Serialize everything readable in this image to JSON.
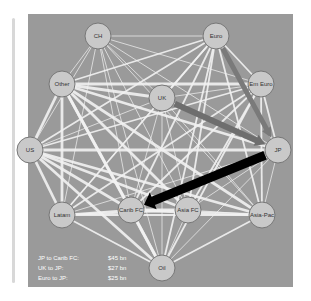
{
  "nodes": [
    {
      "id": "CH",
      "label": "CH",
      "x": 98,
      "y": 36
    },
    {
      "id": "Euro",
      "label": "Euro",
      "x": 216,
      "y": 36
    },
    {
      "id": "Other",
      "label": "Other",
      "x": 62,
      "y": 84
    },
    {
      "id": "UK",
      "label": "UK",
      "x": 162,
      "y": 98
    },
    {
      "id": "EmEuro",
      "label": "Em Euro",
      "x": 261,
      "y": 84
    },
    {
      "id": "US",
      "label": "US",
      "x": 30,
      "y": 150
    },
    {
      "id": "JP",
      "label": "JP",
      "x": 278,
      "y": 150
    },
    {
      "id": "Latam",
      "label": "Latam",
      "x": 62,
      "y": 215
    },
    {
      "id": "CaribFC",
      "label": "Carib FC",
      "x": 131,
      "y": 210
    },
    {
      "id": "AsiaFC",
      "label": "Asia FC",
      "x": 188,
      "y": 210
    },
    {
      "id": "AsiaPac",
      "label": "Asia-Pac",
      "x": 262,
      "y": 215
    },
    {
      "id": "Oil",
      "label": "Oil",
      "x": 162,
      "y": 268
    }
  ],
  "highlight_edges": [
    {
      "from": "JP",
      "to": "CaribFC",
      "label": "JP to Carib FC:",
      "value": "$45 bn",
      "color": "#000000",
      "width": 9
    },
    {
      "from": "UK",
      "to": "JP",
      "label": "UK to JP:",
      "value": "$27 bn",
      "color": "#6e6e6e",
      "width": 6
    },
    {
      "from": "Euro",
      "to": "JP",
      "label": "Euro to JP:",
      "value": "$25 bn",
      "color": "#7a7a7a",
      "width": 5
    }
  ],
  "legend": {
    "rows": [
      {
        "label": "JP to Carib FC:",
        "value": "$45 bn"
      },
      {
        "label": "UK to JP:",
        "value": "$27 bn"
      },
      {
        "label": "Euro to JP:",
        "value": "$25 bn"
      }
    ]
  }
}
